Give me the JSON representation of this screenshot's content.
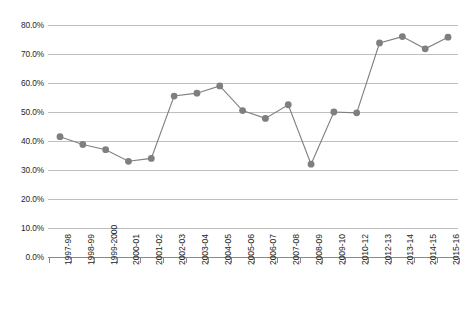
{
  "chart_data": {
    "type": "line",
    "title": "",
    "subtitle": "",
    "xlabel": "",
    "ylabel": "",
    "categories": [
      "1997-98",
      "1998-99",
      "1999-2000",
      "2000-01",
      "2001-02",
      "2002-03",
      "2003-04",
      "2004-05",
      "2005-06",
      "2006-07",
      "2007-08",
      "2008-09",
      "2009-10",
      "2010-12",
      "2012-13",
      "2013-14",
      "2014-15",
      "2015-16"
    ],
    "values": [
      41.5,
      38.8,
      37.0,
      33.0,
      34.0,
      55.5,
      56.5,
      59.0,
      50.5,
      47.8,
      52.5,
      32.0,
      50.0,
      49.7,
      73.8,
      76.0,
      71.8,
      75.8
    ],
    "ylim": [
      0,
      80
    ],
    "ytick_values": [
      0,
      10,
      20,
      30,
      40,
      50,
      60,
      70,
      80
    ],
    "ytick_labels": [
      "0.0%",
      "10.0%",
      "20.0%",
      "30.0%",
      "40.0%",
      "50.0%",
      "60.0%",
      "70.0%",
      "80.0%"
    ],
    "grid": true,
    "legend": false,
    "legend_position": "none",
    "marker": "circle",
    "series_color": "#7f7f7f",
    "gridline_color": "#bfbfbf",
    "axis_color": "#898989",
    "text_color": "#262626",
    "background_color": "#ffffff"
  }
}
